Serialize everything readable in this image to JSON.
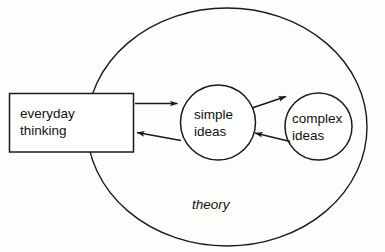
{
  "diagram": {
    "title": "theory",
    "container": {
      "label": "theory",
      "shape": "ellipse",
      "name": "theory-ellipse"
    },
    "nodes": [
      {
        "id": "everyday-thinking",
        "shape": "rectangle",
        "line1": "everyday",
        "line2": "thinking",
        "inside_container": false
      },
      {
        "id": "simple-ideas",
        "shape": "circle",
        "line1": "simple",
        "line2": "ideas",
        "inside_container": true
      },
      {
        "id": "complex-ideas",
        "shape": "circle",
        "line1": "complex",
        "line2": "ideas",
        "inside_container": true
      }
    ],
    "edges": [
      {
        "id": "everyday-to-simple",
        "from": "everyday-thinking",
        "to": "simple-ideas",
        "direction": "right"
      },
      {
        "id": "simple-to-everyday",
        "from": "simple-ideas",
        "to": "everyday-thinking",
        "direction": "left"
      },
      {
        "id": "simple-to-complex",
        "from": "simple-ideas",
        "to": "complex-ideas",
        "direction": "right"
      },
      {
        "id": "complex-to-simple",
        "from": "complex-ideas",
        "to": "simple-ideas",
        "direction": "left"
      }
    ],
    "colors": {
      "stroke": "#1a1a1a",
      "fill": "#ffffff",
      "text": "#111111",
      "background": "#fdfdfc"
    }
  }
}
